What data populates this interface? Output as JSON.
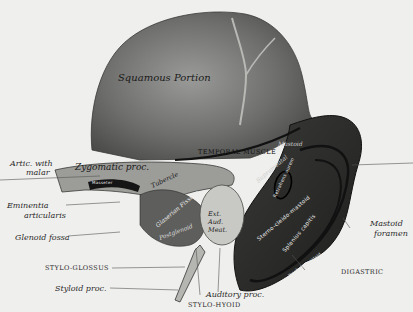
{
  "figure": {
    "regions": {
      "squamous": "Squamous Portion",
      "zygomatic": "Zygomatic proc.",
      "tubercle": "Tubercle",
      "glenoid_fissure": "Glaserian Fissure",
      "post_glenoid": "Postglenoid",
      "ext_auditory_meatus": "Ext. Aud. Meat.",
      "suprameatal": "Suprameatal",
      "mastoid": "Mastoid"
    },
    "muscle_labels": {
      "temporal": "Temporal muscle",
      "masseter": "Masseter",
      "retrahens": "Retrahens aurem",
      "sterno_mastoid": "Sterno-cleido-mastoid",
      "splenius": "Splenius capitis",
      "trachelo": "Trachelo-mastoid"
    },
    "callouts": {
      "artic_malar_1": "Artic. with",
      "artic_malar_2": "malar",
      "eminentia_1": "Eminentia",
      "eminentia_2": "articularis",
      "glenoid_fossa": "Glenoid fossa",
      "stylo_glossus": "Stylo-glossus",
      "styloid_proc": "Styloid proc.",
      "stylo_hyoid": "Stylo-hyoid",
      "auditory_proc": "Auditory proc.",
      "digastric": "Digastric",
      "mastoid_foramen_1": "Mastoid",
      "mastoid_foramen_2": "foramen"
    }
  }
}
